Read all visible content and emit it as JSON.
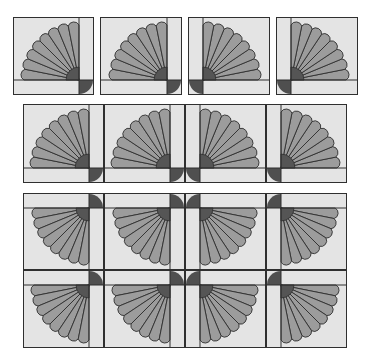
{
  "colors": {
    "background": "#e4e4e4",
    "petal": "#9c9c9c",
    "center": "#555555",
    "corner": "#4f4f4f",
    "line": "#2f2f2f"
  },
  "sections": [
    {
      "name": "single-blocks-row",
      "description": "Four separate fan blocks in four rotations",
      "blocks": [
        {
          "x": 13,
          "y": 17,
          "w": 81,
          "h": 78,
          "orientation": "fan-left-up"
        },
        {
          "x": 100,
          "y": 17,
          "w": 82,
          "h": 78,
          "orientation": "fan-left-up"
        },
        {
          "x": 188,
          "y": 17,
          "w": 82,
          "h": 78,
          "orientation": "fan-right-up"
        },
        {
          "x": 276,
          "y": 17,
          "w": 82,
          "h": 78,
          "orientation": "fan-right-up"
        }
      ]
    },
    {
      "name": "joined-row",
      "description": "Four blocks joined in a row",
      "blocks": [
        {
          "x": 23,
          "y": 104,
          "w": 81,
          "h": 79,
          "orientation": "fan-left-up"
        },
        {
          "x": 104,
          "y": 104,
          "w": 81,
          "h": 79,
          "orientation": "fan-left-up"
        },
        {
          "x": 185,
          "y": 104,
          "w": 81,
          "h": 79,
          "orientation": "fan-right-up"
        },
        {
          "x": 266,
          "y": 104,
          "w": 81,
          "h": 79,
          "orientation": "fan-right-up"
        }
      ]
    },
    {
      "name": "joined-grid",
      "description": "Two rows of four blocks joined, fans pointing downward",
      "blocks": [
        {
          "x": 23,
          "y": 193,
          "w": 81,
          "h": 77,
          "orientation": "fan-left-down"
        },
        {
          "x": 104,
          "y": 193,
          "w": 81,
          "h": 77,
          "orientation": "fan-left-down"
        },
        {
          "x": 185,
          "y": 193,
          "w": 81,
          "h": 77,
          "orientation": "fan-right-down"
        },
        {
          "x": 266,
          "y": 193,
          "w": 81,
          "h": 77,
          "orientation": "fan-right-down"
        },
        {
          "x": 23,
          "y": 270,
          "w": 81,
          "h": 78,
          "orientation": "fan-left-down"
        },
        {
          "x": 104,
          "y": 270,
          "w": 81,
          "h": 78,
          "orientation": "fan-left-down"
        },
        {
          "x": 185,
          "y": 270,
          "w": 81,
          "h": 78,
          "orientation": "fan-right-down"
        },
        {
          "x": 266,
          "y": 270,
          "w": 81,
          "h": 78,
          "orientation": "fan-right-down"
        }
      ]
    }
  ]
}
